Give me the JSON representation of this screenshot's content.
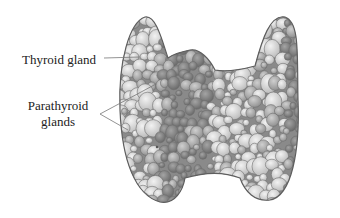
{
  "figure": {
    "labels": {
      "thyroid": "Thyroid gland",
      "parathyroid_line1": "Parathyroid",
      "parathyroid_line2": "glands"
    },
    "colors": {
      "background": "#ffffff",
      "outline": "#6a6a6a",
      "light_cell": "#d8d8d8",
      "mid_cell": "#a9a9a9",
      "dark_cell": "#7d7d7d",
      "leader_line": "#777777",
      "text": "#222222"
    }
  }
}
